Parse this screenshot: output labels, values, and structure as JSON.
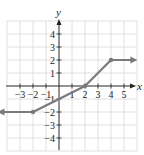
{
  "chart_data": {
    "type": "line",
    "title": "",
    "xlabel": "x",
    "ylabel": "y",
    "xlim": [
      -4,
      6
    ],
    "ylim": [
      -5,
      5
    ],
    "grid": true,
    "x_ticks": [
      -3,
      -2,
      -1,
      1,
      2,
      3,
      4,
      5
    ],
    "y_ticks": [
      -4,
      -3,
      -2,
      -1,
      1,
      2,
      3,
      4
    ],
    "x_tick_labels": [
      "−3",
      "−2",
      "−1",
      "1",
      "2",
      "3",
      "4",
      "5"
    ],
    "y_tick_labels": [
      "−4",
      "−3",
      "−2",
      "−1",
      "1",
      "2",
      "3",
      "4"
    ],
    "series": [
      {
        "name": "piecewise function",
        "points": [
          [
            -4.5,
            -2
          ],
          [
            -2,
            -2
          ],
          [
            0,
            -1
          ],
          [
            2,
            0
          ],
          [
            4,
            2
          ],
          [
            5.8,
            2
          ]
        ],
        "marked_points": [
          [
            -2,
            -2
          ],
          [
            2,
            0
          ],
          [
            4,
            2
          ]
        ],
        "arrows": [
          "left",
          "right"
        ]
      }
    ],
    "colors": {
      "line": "#7a7a7a",
      "grid": "#d8d8d8",
      "axis": "#222222"
    }
  },
  "labels": {
    "x_axis": "x",
    "y_axis": "y"
  }
}
